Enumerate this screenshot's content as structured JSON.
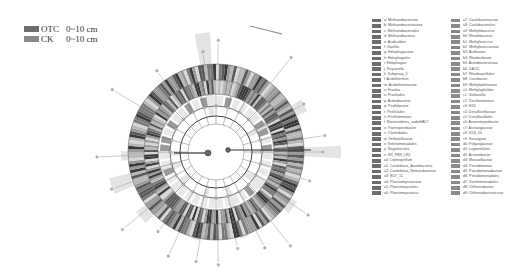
{
  "colors": {
    "OTC": "#6e6e6e",
    "CK": "#8a8a8a",
    "ring_dark": "#555555",
    "ring_mid": "#9a9a9a",
    "ring_light": "#cfcfcf",
    "highlight": "#e4e4e4"
  },
  "chart_data": {
    "type": "cladogram",
    "title": "",
    "groups": [
      {
        "name": "OTC",
        "label": "0~10 cm",
        "color": "#6e6e6e"
      },
      {
        "name": "CK",
        "label": "0~10 cm",
        "color": "#8a8a8a"
      }
    ],
    "rings": [
      "kingdom",
      "phylum",
      "class",
      "order",
      "family",
      "genus"
    ],
    "legend_position": "right",
    "taxa": [
      {
        "code": "a",
        "name": "Methanobacterium",
        "group": "OTC"
      },
      {
        "code": "b",
        "name": "Methanobacteriaceae",
        "group": "OTC"
      },
      {
        "code": "c",
        "name": "Methanobacteriales",
        "group": "OTC"
      },
      {
        "code": "d",
        "name": "Methanobacteria",
        "group": "OTC"
      },
      {
        "code": "e",
        "name": "Acidicaldus",
        "group": "OTC"
      },
      {
        "code": "f",
        "name": "Gaiellia",
        "group": "OTC"
      },
      {
        "code": "g",
        "name": "Holophagaceae",
        "group": "OTC"
      },
      {
        "code": "h",
        "name": "Holophagales",
        "group": "OTC"
      },
      {
        "code": "i",
        "name": "Holophagae",
        "group": "OTC"
      },
      {
        "code": "j",
        "name": "Reyranella",
        "group": "OTC"
      },
      {
        "code": "k",
        "name": "Subgroup_5",
        "group": "OTC"
      },
      {
        "code": "l",
        "name": "Acidothermus",
        "group": "OTC"
      },
      {
        "code": "m",
        "name": "Acidothermaceae",
        "group": "OTC"
      },
      {
        "code": "n",
        "name": "Frankia",
        "group": "OTC"
      },
      {
        "code": "o",
        "name": "Frankiales",
        "group": "OTC"
      },
      {
        "code": "p",
        "name": "Actinobacteria",
        "group": "OTC"
      },
      {
        "code": "q",
        "name": "Pirellulaceae",
        "group": "OTC"
      },
      {
        "code": "r",
        "name": "Pirellulales",
        "group": "OTC"
      },
      {
        "code": "s",
        "name": "Pirellulomonas",
        "group": "OTC"
      },
      {
        "code": "t",
        "name": "Bacteroidetes_vadinHA17",
        "group": "OTC"
      },
      {
        "code": "u",
        "name": "Paenisporobacter",
        "group": "OTC"
      },
      {
        "code": "v",
        "name": "Clostridiales",
        "group": "OTC"
      },
      {
        "code": "w",
        "name": "Veillonellaceae",
        "group": "OTC"
      },
      {
        "code": "x",
        "name": "Selenomonadales",
        "group": "OTC"
      },
      {
        "code": "y",
        "name": "Negativicutes",
        "group": "OTC"
      },
      {
        "code": "z",
        "name": "SR_FBR_L83",
        "group": "OTC"
      },
      {
        "code": "a0",
        "name": "Leptospirillum",
        "group": "OTC"
      },
      {
        "code": "a1",
        "name": "Candidatus_Azambacteria",
        "group": "OTC"
      },
      {
        "code": "a2",
        "name": "Candidatus_Nomurabacteria",
        "group": "OTC"
      },
      {
        "code": "a3",
        "name": "BD7_11",
        "group": "OTC"
      },
      {
        "code": "a4",
        "name": "Planctomycetaceae",
        "group": "OTC"
      },
      {
        "code": "a5",
        "name": "Planctomycetales",
        "group": "OTC"
      },
      {
        "code": "a6",
        "name": "Planctomycetacia",
        "group": "OTC"
      },
      {
        "code": "a7",
        "name": "Caulobacteraceae",
        "group": "CK"
      },
      {
        "code": "a8",
        "name": "Caulobacterales",
        "group": "CK"
      },
      {
        "code": "a9",
        "name": "Methylobacteria",
        "group": "CK"
      },
      {
        "code": "b0",
        "name": "Rhodobacteria",
        "group": "CK"
      },
      {
        "code": "b1",
        "name": "Methylococcus",
        "group": "CK"
      },
      {
        "code": "b2",
        "name": "Methylococcaceae",
        "group": "CK"
      },
      {
        "code": "b3",
        "name": "Acidisoma",
        "group": "CK"
      },
      {
        "code": "b4",
        "name": "Rhodovibrium",
        "group": "CK"
      },
      {
        "code": "b5",
        "name": "Acetobacteraceae",
        "group": "CK"
      },
      {
        "code": "b6",
        "name": "DA111",
        "group": "CK"
      },
      {
        "code": "b7",
        "name": "Rhodospirillales",
        "group": "CK"
      },
      {
        "code": "b8",
        "name": "Curvibacter",
        "group": "CK"
      },
      {
        "code": "b9",
        "name": "Methylophilaceae",
        "group": "CK"
      },
      {
        "code": "c0",
        "name": "Methylophilales",
        "group": "CK"
      },
      {
        "code": "c1",
        "name": "Gallionella",
        "group": "CK"
      },
      {
        "code": "c2",
        "name": "Dechloromonas",
        "group": "CK"
      },
      {
        "code": "c3",
        "name": "H16",
        "group": "CK"
      },
      {
        "code": "c4",
        "name": "Desulfurellaceae",
        "group": "CK"
      },
      {
        "code": "c5",
        "name": "Desulfurellales",
        "group": "CK"
      },
      {
        "code": "c6",
        "name": "Anaeromyxobacter",
        "group": "CK"
      },
      {
        "code": "c7",
        "name": "Archangiaceae",
        "group": "CK"
      },
      {
        "code": "c8",
        "name": "KD3_10",
        "group": "CK"
      },
      {
        "code": "c9",
        "name": "Sorangium",
        "group": "CK"
      },
      {
        "code": "d0",
        "name": "Polyangiaceae",
        "group": "CK"
      },
      {
        "code": "d1",
        "name": "Legionellales",
        "group": "CK"
      },
      {
        "code": "d2",
        "name": "Acinetobacter",
        "group": "CK"
      },
      {
        "code": "d3",
        "name": "Moraxellaceae",
        "group": "CK"
      },
      {
        "code": "d4",
        "name": "Pseudomonas",
        "group": "CK"
      },
      {
        "code": "d5",
        "name": "Pseudomonadaceae",
        "group": "CK"
      },
      {
        "code": "d6",
        "name": "Pseudomonadales",
        "group": "CK"
      },
      {
        "code": "d7",
        "name": "Xanthomonadales",
        "group": "CK"
      },
      {
        "code": "d8",
        "name": "Chthoniobacter",
        "group": "CK"
      },
      {
        "code": "d9",
        "name": "Chthoniobacteraceae",
        "group": "CK"
      }
    ],
    "axis_labels": [
      "Actinobacteria",
      "Bacteroidetes",
      "Proteobacteria",
      "Firmicutes",
      "Planctomycetes"
    ]
  },
  "legend": {
    "groups": [
      {
        "name": "OTC",
        "label": "0~10 cm"
      },
      {
        "name": "CK",
        "label": "0~10 cm"
      }
    ]
  }
}
